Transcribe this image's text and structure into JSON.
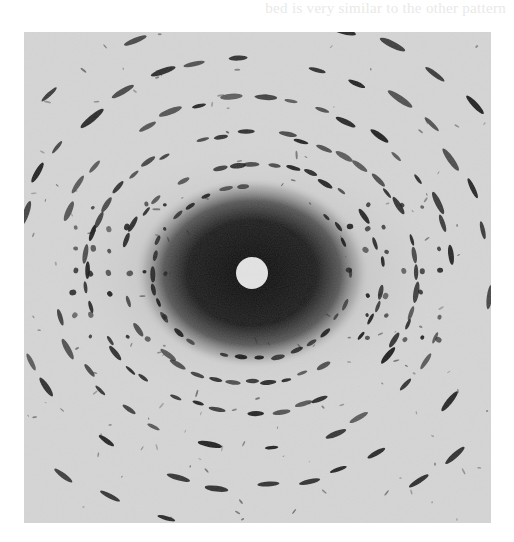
{
  "page": {
    "background": "#ffffff",
    "bleed_through_top": "bed is very similar to the other pattern",
    "bleed_through_bottom": ""
  },
  "figure": {
    "frame": {
      "x": 24,
      "y": 32,
      "width": 467,
      "height": 491
    },
    "colors": {
      "film_background": "#d6d6d6",
      "halo": "#111111",
      "spot": "#1a1a1a",
      "beam_stop": "#e4e4e4"
    },
    "center": {
      "x": 228,
      "y": 241
    },
    "halo": {
      "rx": 118,
      "ry": 96
    },
    "beam_stop": {
      "r": 16
    },
    "rings": [
      {
        "rx": 60,
        "ry": 52,
        "count": 22,
        "size": 2.2
      },
      {
        "rx": 100,
        "ry": 86,
        "count": 34,
        "size": 2.6
      },
      {
        "rx": 130,
        "ry": 110,
        "count": 44,
        "size": 2.8
      },
      {
        "rx": 165,
        "ry": 140,
        "count": 50,
        "size": 3.0
      },
      {
        "rx": 200,
        "ry": 175,
        "count": 40,
        "size": 3.2
      },
      {
        "rx": 240,
        "ry": 215,
        "count": 36,
        "size": 3.4
      },
      {
        "rx": 290,
        "ry": 260,
        "count": 34,
        "size": 3.6
      }
    ],
    "side_lattice": {
      "left": {
        "cx": 95,
        "cy": 240,
        "rows": 7,
        "cols": 6,
        "dx": 18,
        "dy": 22
      },
      "right": {
        "cx": 370,
        "cy": 240,
        "rows": 7,
        "cols": 6,
        "dx": 18,
        "dy": 22
      }
    }
  }
}
